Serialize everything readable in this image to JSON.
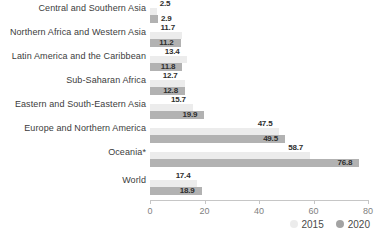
{
  "chart_data": {
    "type": "bar",
    "orientation": "horizontal",
    "title": "",
    "xlabel": "",
    "ylabel": "",
    "xlim": [
      0,
      80
    ],
    "xticks": [
      0,
      20,
      40,
      60,
      80
    ],
    "grid": false,
    "legend_position": "bottom-right",
    "categories": [
      "Central and Southern Asia",
      "Northern Africa and Western Asia",
      "Latin America and the Caribbean",
      "Sub-Saharan Africa",
      "Eastern and South-Eastern Asia",
      "Europe and Northern America",
      "Oceania*",
      "World"
    ],
    "series": [
      {
        "name": "2015",
        "color": "#ececec",
        "legend_marker_color": "#ececec",
        "values": [
          2.5,
          11.7,
          13.4,
          12.7,
          15.7,
          47.5,
          58.7,
          17.4
        ]
      },
      {
        "name": "2020",
        "color": "#b2b2b2",
        "legend_marker_color": "#a3a3a3",
        "values": [
          2.9,
          11.2,
          11.8,
          12.8,
          19.9,
          49.5,
          76.8,
          18.9
        ]
      }
    ]
  }
}
